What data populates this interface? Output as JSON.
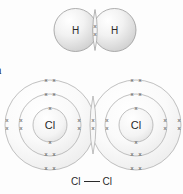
{
  "diagram": {
    "title_fragment": "n",
    "background_color": "#fdfdfd",
    "outline_color": "#9a9a9a",
    "shell_color": "#9e9e9e",
    "electron_color": "#4a4a4a",
    "label_color": "#2a2a2a"
  },
  "molecules": [
    {
      "id": "hydrogen-molecule",
      "formula": "H2",
      "atoms": [
        {
          "id": "hydrogen-left",
          "symbol": "H",
          "cx": 75.5,
          "cy": 30,
          "r": 21.5,
          "shells": 1
        },
        {
          "id": "hydrogen-right",
          "symbol": "H",
          "cx": 114.5,
          "cy": 30,
          "r": 21.5,
          "shells": 1
        }
      ],
      "shared_pair": {
        "id": "hydrogen-shared-pair",
        "cx": 95,
        "cy": 30,
        "marks": 2
      }
    },
    {
      "id": "chlorine-molecule",
      "formula": "Cl2",
      "atoms": [
        {
          "id": "chlorine-left",
          "symbol": "Cl",
          "cx": 50,
          "cy": 125,
          "shell_radii": [
            17,
            31,
            45
          ],
          "shells": 3
        },
        {
          "id": "chlorine-right",
          "symbol": "Cl",
          "cx": 136,
          "cy": 125,
          "shell_radii": [
            17,
            31,
            45
          ],
          "shells": 3
        }
      ],
      "shared_pair": {
        "id": "chlorine-shared-pair",
        "cx": 93,
        "cy": 125,
        "marks": 2
      }
    }
  ],
  "structural_formula": {
    "left_symbol": "Cl",
    "right_symbol": "Cl",
    "bond_type": "single"
  },
  "electron_symbol": "x"
}
